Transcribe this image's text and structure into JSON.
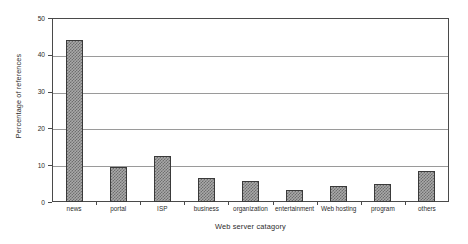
{
  "chart_data": {
    "type": "bar",
    "title": "",
    "xlabel": "Web server catagory",
    "ylabel": "Percentage of references",
    "categories": [
      "news",
      "portal",
      "ISP",
      "business",
      "organization",
      "entertainment",
      "Web hosting",
      "program",
      "others"
    ],
    "values": [
      44,
      9.5,
      12.5,
      6.5,
      5.7,
      3.3,
      4.3,
      5.0,
      8.3
    ],
    "ylim": [
      0,
      50
    ],
    "yticks": [
      0,
      10,
      20,
      30,
      40,
      50
    ],
    "ytick_labels": [
      "0",
      "10",
      "20",
      "30",
      "40",
      "50"
    ],
    "grid": true,
    "grid_axis": "y",
    "legend": false,
    "bar_fill": "#a9a9a9",
    "bar_edge": "#3a3a3a",
    "axis_color": "#4a4a4a",
    "grid_color": "#9a9a9a",
    "background": "#ffffff"
  }
}
